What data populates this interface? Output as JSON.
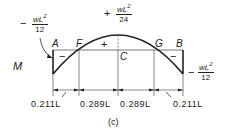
{
  "diagram": {
    "caption": "(c)",
    "axis_label": "M",
    "points": {
      "A": "A",
      "F": "F",
      "C": "C",
      "G": "G",
      "B": "B"
    },
    "moments": {
      "left_end": {
        "sign": "−",
        "numerator": "wL",
        "exp": "2",
        "denominator": "12"
      },
      "midspan": {
        "sign": "+",
        "numerator": "wL",
        "exp": "2",
        "denominator": "24"
      },
      "right_end": {
        "sign": "−",
        "numerator": "wL",
        "exp": "2",
        "denominator": "12"
      }
    },
    "region_signs": {
      "left": "−",
      "middle": "+",
      "right": "−"
    },
    "dimensions": [
      "0.211L",
      "0.289L",
      "0.289L",
      "0.211L"
    ],
    "colors": {
      "ink": "#222222",
      "background": "#ffffff"
    }
  }
}
